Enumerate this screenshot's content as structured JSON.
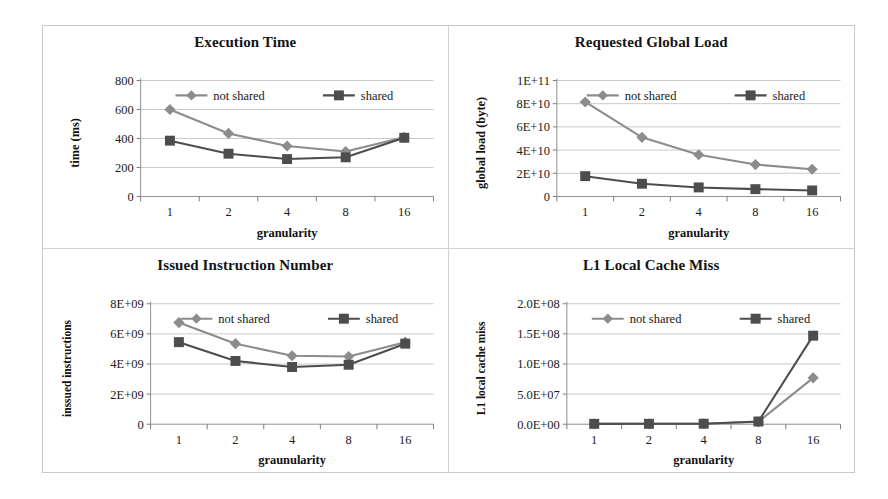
{
  "figure": {
    "background": "#ffffff",
    "frame_color": "#c9c9c9",
    "divider_color": "#d2d2d2"
  },
  "series_style": {
    "not_shared": {
      "label": "not shared",
      "color": "#8c8c8c",
      "marker": "diamond"
    },
    "shared": {
      "label": "shared",
      "color": "#4d4d4d",
      "marker": "square"
    }
  },
  "legend": {
    "not_shared_label": "not shared",
    "shared_label": "shared"
  },
  "chart_data": [
    {
      "id": "execution-time",
      "type": "line",
      "title": "Execution Time",
      "xlabel": "granularity",
      "ylabel": "time (ms)",
      "categories": [
        "1",
        "2",
        "4",
        "8",
        "16"
      ],
      "ylim": [
        0,
        800
      ],
      "yticks": [
        0,
        200,
        400,
        600,
        800
      ],
      "ytick_labels": [
        "0",
        "200",
        "400",
        "600",
        "800"
      ],
      "grid": true,
      "legend_position": "top-inside",
      "series": [
        {
          "name": "not shared",
          "values": [
            600,
            435,
            348,
            310,
            408
          ]
        },
        {
          "name": "shared",
          "values": [
            385,
            295,
            258,
            270,
            405
          ]
        }
      ]
    },
    {
      "id": "requested-global-load",
      "type": "line",
      "title": "Requested Global Load",
      "xlabel": "granularity",
      "ylabel": "global load (byte)",
      "categories": [
        "1",
        "2",
        "4",
        "8",
        "16"
      ],
      "ylim": [
        0,
        100000000000
      ],
      "yticks": [
        0,
        20000000000,
        40000000000,
        60000000000,
        80000000000,
        100000000000
      ],
      "ytick_labels": [
        "0",
        "2E+10",
        "4E+10",
        "6E+10",
        "8E+10",
        "1E+11"
      ],
      "grid": true,
      "legend_position": "top-inside",
      "series": [
        {
          "name": "not shared",
          "values": [
            81500000000,
            51000000000,
            36000000000,
            27500000000,
            23500000000
          ]
        },
        {
          "name": "shared",
          "values": [
            17500000000,
            11000000000,
            7800000000,
            6300000000,
            5200000000
          ]
        }
      ]
    },
    {
      "id": "issued-instruction-number",
      "type": "line",
      "title": "Issued Instruction Number",
      "xlabel": "graunularity",
      "ylabel": "inssued instructions",
      "categories": [
        "1",
        "2",
        "4",
        "8",
        "16"
      ],
      "ylim": [
        0,
        8000000000
      ],
      "yticks": [
        0,
        2000000000,
        4000000000,
        6000000000,
        8000000000
      ],
      "ytick_labels": [
        "0",
        "2E+09",
        "4E+09",
        "6E+09",
        "8E+09"
      ],
      "grid": true,
      "legend_position": "top-inside",
      "series": [
        {
          "name": "not shared",
          "values": [
            6750000000,
            5350000000,
            4550000000,
            4500000000,
            5450000000
          ]
        },
        {
          "name": "shared",
          "values": [
            5450000000,
            4200000000,
            3800000000,
            3950000000,
            5350000000
          ]
        }
      ]
    },
    {
      "id": "l1-local-cache-miss",
      "type": "line",
      "title": "L1 Local Cache Miss",
      "xlabel": "granularity",
      "ylabel": "L1 local cache miss",
      "categories": [
        "1",
        "2",
        "4",
        "8",
        "16"
      ],
      "ylim": [
        0,
        200000000
      ],
      "yticks": [
        0,
        50000000,
        100000000,
        150000000,
        200000000
      ],
      "ytick_labels": [
        "0.0E+00",
        "5.0E+07",
        "1.0E+08",
        "1.5E+08",
        "2.0E+08"
      ],
      "grid": true,
      "legend_position": "top-inside",
      "series": [
        {
          "name": "not shared",
          "values": [
            500000,
            600000,
            700000,
            4000000,
            77000000
          ]
        },
        {
          "name": "shared",
          "values": [
            600000,
            700000,
            800000,
            4500000,
            147000000
          ]
        }
      ]
    }
  ]
}
